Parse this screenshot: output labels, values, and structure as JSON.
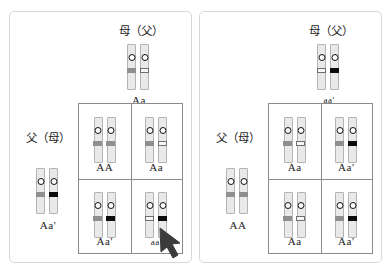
{
  "figure": {
    "title": "",
    "allele_legend": {
      "A": "gray-band",
      "a": "white-band",
      "a_prime": "black-band"
    }
  },
  "panels": [
    {
      "id": "left",
      "mother": {
        "label": "母（父）",
        "genotype": "Aa",
        "chromosomes": [
          "A",
          "a"
        ]
      },
      "father": {
        "label": "父（母）",
        "genotype": "Aa'",
        "chromosomes": [
          "A",
          "a2"
        ]
      },
      "punnett": {
        "cells": [
          {
            "genotype": "AA",
            "chromosomes": [
              "A",
              "A"
            ]
          },
          {
            "genotype": "Aa",
            "chromosomes": [
              "A",
              "a"
            ]
          },
          {
            "genotype": "Aa'",
            "chromosomes": [
              "A",
              "a2"
            ]
          },
          {
            "genotype": "aa'",
            "chromosomes": [
              "a",
              "a2"
            ]
          }
        ],
        "highlight_index": 3
      },
      "annotation": {
        "arrow": "pointer-arrow",
        "target": "aa'"
      }
    },
    {
      "id": "right",
      "mother": {
        "label": "母（父）",
        "genotype": "aa'",
        "chromosomes": [
          "a",
          "a2"
        ]
      },
      "father": {
        "label": "父（母）",
        "genotype": "AA",
        "chromosomes": [
          "A",
          "A"
        ]
      },
      "punnett": {
        "cells": [
          {
            "genotype": "Aa",
            "chromosomes": [
              "A",
              "a"
            ]
          },
          {
            "genotype": "Aa'",
            "chromosomes": [
              "A",
              "a2"
            ]
          },
          {
            "genotype": "Aa",
            "chromosomes": [
              "A",
              "a"
            ]
          },
          {
            "genotype": "Aa'",
            "chromosomes": [
              "A",
              "a2"
            ]
          }
        ],
        "highlight_index": -1
      },
      "annotation": null
    }
  ],
  "colors": {
    "allele_A_band": "#8f8f8f",
    "allele_a_band": "#f7f7f7",
    "allele_a_prime_band": "#0b0b0b",
    "chromosome_body": "#e9e9e9",
    "chromosome_outline": "#b4b4b4",
    "grid_line": "#8a8a8a",
    "panel_border": "#d8d8d8"
  }
}
